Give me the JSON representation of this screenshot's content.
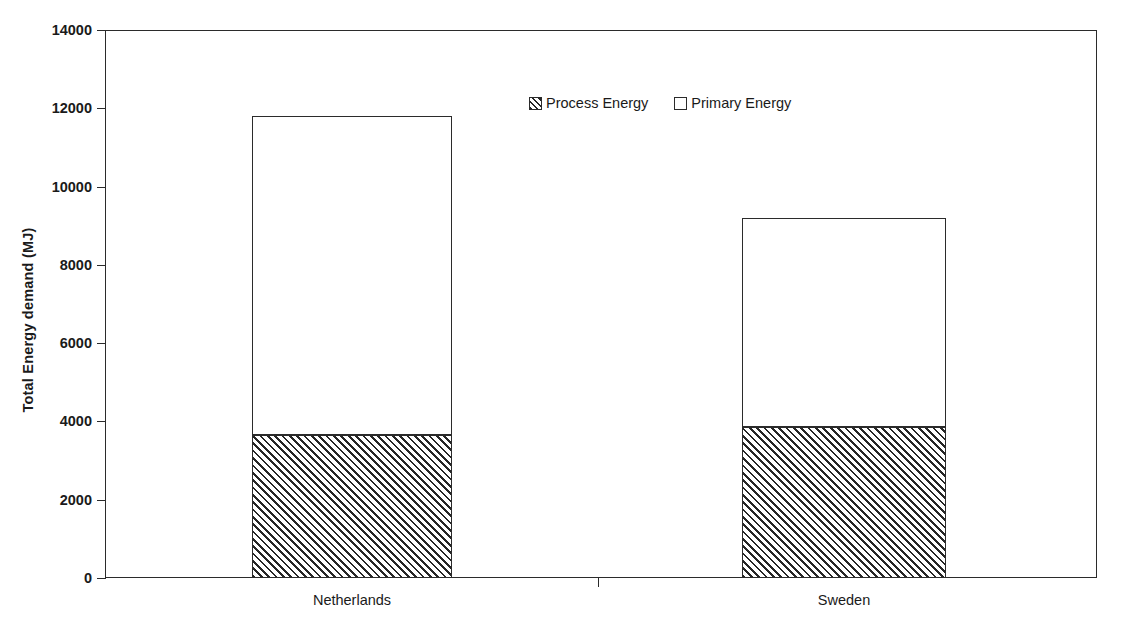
{
  "chart_data": {
    "type": "bar",
    "subtype": "stacked-bar",
    "title": "",
    "xlabel": "",
    "ylabel": "Total Energy demand (MJ)",
    "categories": [
      "Netherlands",
      "Sweden"
    ],
    "series": [
      {
        "name": "Process Energy",
        "values": [
          3650,
          3850
        ],
        "fill": "diagonal-hatch",
        "color": "#262626"
      },
      {
        "name": "Primary Energy",
        "values": [
          8150,
          5350
        ],
        "fill": "solid-white",
        "color": "#ffffff"
      }
    ],
    "totals": [
      11800,
      9200
    ],
    "ylim": [
      0,
      14000
    ],
    "ytick_step": 2000,
    "yticks": [
      0,
      2000,
      4000,
      6000,
      8000,
      10000,
      12000,
      14000
    ],
    "ytick_labels": [
      "0",
      "2000",
      "4000",
      "6000",
      "8000",
      "10000",
      "12000",
      "14000"
    ],
    "grid": false,
    "frame": "box",
    "legend_position": "upper-center",
    "legend_entries": [
      "Process Energy",
      "Primary Energy"
    ]
  },
  "axes": {
    "y_title": "Total Energy demand (MJ)",
    "y_tick_labels": [
      "14000",
      "12000",
      "10000",
      "8000",
      "6000",
      "4000",
      "2000",
      "0"
    ],
    "x_tick_labels": [
      "Netherlands",
      "Sweden"
    ]
  },
  "legend": {
    "items": [
      {
        "label": "Process Energy",
        "swatch": "hatched-square-icon"
      },
      {
        "label": "Primary Energy",
        "swatch": "empty-square-icon"
      }
    ]
  },
  "colors": {
    "axis": "#2b2b2b",
    "hatch": "#262626",
    "background": "#ffffff",
    "text": "#1a1a1a"
  }
}
